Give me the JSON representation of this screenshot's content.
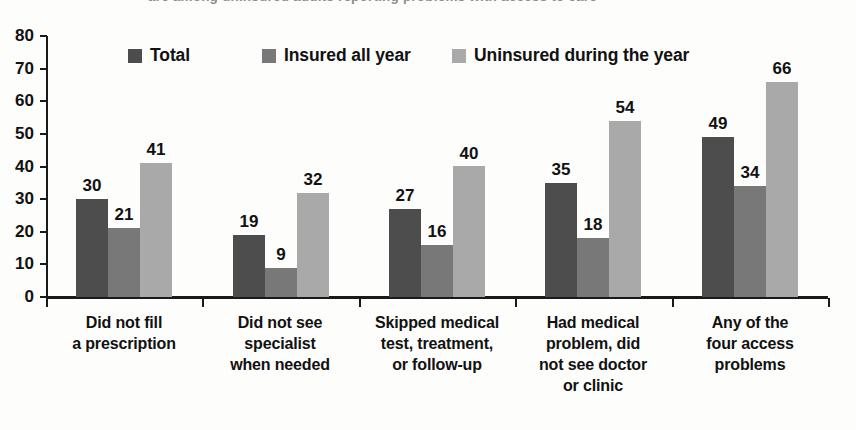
{
  "title": {
    "truncated_top_text": "are among uninsured adults reporting problems with access to care"
  },
  "legend": {
    "position": "top-inside",
    "items": [
      {
        "label": "Total",
        "color": "#4d4d4d"
      },
      {
        "label": "Insured all year",
        "color": "#787878"
      },
      {
        "label": "Uninsured during the year",
        "color": "#a9a9a9"
      }
    ]
  },
  "axis": {
    "y_ticks": [
      "0",
      "10",
      "20",
      "30",
      "40",
      "50",
      "60",
      "70",
      "80"
    ]
  },
  "chart_data": {
    "type": "bar",
    "title": "",
    "xlabel": "",
    "ylabel": "",
    "ylim": [
      0,
      80
    ],
    "ytick_step": 10,
    "grid": false,
    "legend_position": "top-inside",
    "categories": [
      "Did not fill\na prescription",
      "Did not see\nspecialist\nwhen needed",
      "Skipped medical\ntest, treatment,\nor follow-up",
      "Had medical\nproblem, did\nnot see doctor\nor clinic",
      "Any of the\nfour access\nproblems"
    ],
    "category_lines": [
      [
        "Did not fill",
        "a prescription"
      ],
      [
        "Did not see",
        "specialist",
        "when needed"
      ],
      [
        "Skipped medical",
        "test, treatment,",
        "or follow-up"
      ],
      [
        "Had medical",
        "problem, did",
        "not see doctor",
        "or clinic"
      ],
      [
        "Any of the",
        "four access",
        "problems"
      ]
    ],
    "series": [
      {
        "name": "Total",
        "color": "#4d4d4d",
        "values": [
          30,
          19,
          27,
          35,
          49
        ]
      },
      {
        "name": "Insured all year",
        "color": "#787878",
        "values": [
          21,
          9,
          16,
          18,
          34
        ]
      },
      {
        "name": "Uninsured during the year",
        "color": "#a9a9a9",
        "values": [
          41,
          32,
          40,
          54,
          66
        ]
      }
    ]
  }
}
